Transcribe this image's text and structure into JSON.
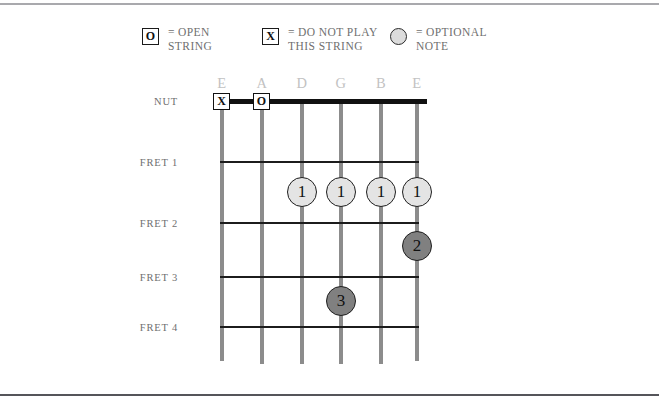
{
  "legend": {
    "items": [
      {
        "id": "open-string",
        "symbol": "O",
        "symbol_kind": "boxed",
        "equals": "=",
        "text": "OPEN\nSTRING"
      },
      {
        "id": "do-not-play",
        "symbol": "X",
        "symbol_kind": "boxed",
        "equals": "=",
        "text": "DO NOT PLAY\nTHIS STRING"
      },
      {
        "id": "optional-note",
        "symbol": "",
        "symbol_kind": "circle",
        "equals": "=",
        "text": "OPTIONAL\nNOTE"
      }
    ]
  },
  "diagram": {
    "type": "guitar-chord-diagram",
    "string_labels": [
      "E",
      "A",
      "D",
      "G",
      "B",
      "E"
    ],
    "fret_labels": [
      "NUT",
      "FRET 1",
      "FRET 2",
      "FRET 3",
      "FRET 4"
    ],
    "nut_markers": [
      {
        "string": "E",
        "symbol": "X",
        "meaning": "do-not-play"
      },
      {
        "string": "A",
        "symbol": "O",
        "meaning": "open-string"
      }
    ],
    "finger_dots": [
      {
        "string": "D",
        "fret": 1,
        "finger": "1",
        "style": "optional"
      },
      {
        "string": "G",
        "fret": 1,
        "finger": "1",
        "style": "optional"
      },
      {
        "string": "B",
        "fret": 1,
        "finger": "1",
        "style": "optional"
      },
      {
        "string": "E",
        "fret": 1,
        "finger": "1",
        "style": "optional"
      },
      {
        "string": "E",
        "fret": 2,
        "finger": "2",
        "style": "required"
      },
      {
        "string": "G",
        "fret": 4,
        "finger": "3",
        "style": "required"
      }
    ],
    "colors": {
      "string": "#8c8c8c",
      "fret": "#1c1c1c",
      "nut": "#111111",
      "optional_dot_fill": "#e4e4e4",
      "required_dot_fill": "#808080",
      "label_text": "#6f6f6f",
      "string_label_text": "#c2c2c2"
    }
  }
}
